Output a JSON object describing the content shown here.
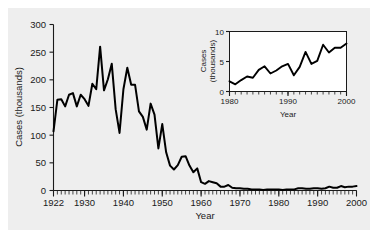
{
  "figure": {
    "background_color": "#eeeeee",
    "page_color": "#ffffff",
    "line_color": "#000000"
  },
  "chart_data": {
    "type": "line",
    "title": "",
    "xlabel": "Year",
    "ylabel": "Cases (thousands)",
    "xlim": [
      1922,
      2000
    ],
    "ylim": [
      0,
      300
    ],
    "grid": false,
    "legend": "none",
    "xticks": [
      1922,
      1930,
      1940,
      1950,
      1960,
      1970,
      1980,
      1990,
      2000
    ],
    "xtick_labels": [
      "1922",
      "1930",
      "1940",
      "1950",
      "1960",
      "1970",
      "1980",
      "1990",
      "2000"
    ],
    "yticks": [
      0,
      50,
      100,
      150,
      200,
      250,
      300
    ],
    "ytick_labels": [
      "0",
      "50",
      "100",
      "150",
      "200",
      "250",
      "300"
    ],
    "minor_xticks_every": 1,
    "x": [
      1922,
      1923,
      1924,
      1925,
      1926,
      1927,
      1928,
      1929,
      1930,
      1931,
      1932,
      1933,
      1934,
      1935,
      1936,
      1937,
      1938,
      1939,
      1940,
      1941,
      1942,
      1943,
      1944,
      1945,
      1946,
      1947,
      1948,
      1949,
      1950,
      1951,
      1952,
      1953,
      1954,
      1955,
      1956,
      1957,
      1958,
      1959,
      1960,
      1961,
      1962,
      1963,
      1964,
      1965,
      1966,
      1967,
      1968,
      1969,
      1970,
      1971,
      1972,
      1973,
      1974,
      1975,
      1976,
      1977,
      1978,
      1979,
      1980,
      1981,
      1982,
      1983,
      1984,
      1985,
      1986,
      1987,
      1988,
      1989,
      1990,
      1991,
      1992,
      1993,
      1994,
      1995,
      1996,
      1997,
      1998,
      1999,
      2000
    ],
    "y": [
      107,
      164,
      165,
      152,
      173,
      176,
      152,
      173,
      165,
      153,
      193,
      183,
      260,
      181,
      201,
      229,
      147,
      104,
      183,
      222,
      191,
      191,
      143,
      133,
      110,
      157,
      137,
      76,
      120,
      69,
      45,
      38,
      46,
      61,
      62,
      45,
      33,
      40,
      15,
      12,
      17,
      15,
      13,
      7,
      7,
      10,
      5,
      4,
      4,
      3,
      3,
      2,
      2,
      2,
      1,
      2,
      2,
      2,
      2,
      1,
      2,
      2,
      2,
      4,
      4,
      3,
      3,
      4,
      4,
      3,
      4,
      7,
      5,
      5,
      8,
      6,
      7,
      7,
      8
    ],
    "series": [
      {
        "name": "Pertussis cases (thousands)",
        "values": [
          107,
          164,
          165,
          152,
          173,
          176,
          152,
          173,
          165,
          153,
          193,
          183,
          260,
          181,
          201,
          229,
          147,
          104,
          183,
          222,
          191,
          191,
          143,
          133,
          110,
          157,
          137,
          76,
          120,
          69,
          45,
          38,
          46,
          61,
          62,
          45,
          33,
          40,
          15,
          12,
          17,
          15,
          13,
          7,
          7,
          10,
          5,
          4,
          4,
          3,
          3,
          2,
          2,
          2,
          1,
          2,
          2,
          2,
          2,
          1,
          2,
          2,
          2,
          4,
          4,
          3,
          3,
          4,
          4,
          3,
          4,
          7,
          5,
          5,
          8,
          6,
          7,
          7,
          8
        ]
      }
    ],
    "inset": {
      "type": "line",
      "xlabel": "Year",
      "ylabel_line1": "Cases",
      "ylabel_line2": "(thousands)",
      "xlim": [
        1980,
        2000
      ],
      "ylim": [
        0,
        10
      ],
      "grid": false,
      "xticks": [
        1980,
        1990,
        2000
      ],
      "xtick_labels": [
        "1980",
        "1990",
        "2000"
      ],
      "yticks": [
        0,
        5,
        10
      ],
      "ytick_labels": [
        "0",
        "5",
        "10"
      ],
      "minor_xticks_every": 1,
      "x": [
        1980,
        1981,
        1982,
        1983,
        1984,
        1985,
        1986,
        1987,
        1988,
        1989,
        1990,
        1991,
        1992,
        1993,
        1994,
        1995,
        1996,
        1997,
        1998,
        1999,
        2000
      ],
      "y": [
        1.7,
        1.2,
        1.9,
        2.5,
        2.3,
        3.6,
        4.2,
        3.0,
        3.5,
        4.2,
        4.6,
        2.7,
        4.1,
        6.6,
        4.6,
        5.1,
        7.8,
        6.5,
        7.3,
        7.3,
        8.0
      ],
      "series": [
        {
          "name": "Pertussis cases (thousands)",
          "values": [
            1.7,
            1.2,
            1.9,
            2.5,
            2.3,
            3.6,
            4.2,
            3.0,
            3.5,
            4.2,
            4.6,
            2.7,
            4.1,
            6.6,
            4.6,
            5.1,
            7.8,
            6.5,
            7.3,
            7.3,
            8.0
          ]
        }
      ]
    }
  },
  "labels": {
    "main_ylabel": "Cases (thousands)",
    "main_xlabel": "Year",
    "inset_ylabel_1": "Cases",
    "inset_ylabel_2": "(thousands)",
    "inset_xlabel": "Year"
  }
}
